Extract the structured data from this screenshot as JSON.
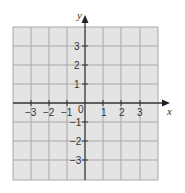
{
  "diagram": {
    "type": "coordinate-grid",
    "colors": {
      "grid_fill": "#e4e4e4",
      "grid_line": "#a8a8a8",
      "axis": "#333333"
    },
    "x_axis": {
      "label": "x",
      "min": -4,
      "max": 4,
      "tick_labels": [
        "−3",
        "−2",
        "−1",
        "0",
        "1",
        "2",
        "3"
      ]
    },
    "y_axis": {
      "label": "y",
      "min": -4,
      "max": 4,
      "tick_labels": [
        "3",
        "2",
        "1",
        "−1",
        "−2",
        "−3"
      ]
    },
    "labels": {
      "x": "x",
      "y": "y",
      "origin": "0",
      "xn3": "−3",
      "xn2": "−2",
      "xn1": "−1",
      "x1": "1",
      "x2": "2",
      "x3": "3",
      "y3": "3",
      "y2": "2",
      "y1": "1",
      "yn1": "−1",
      "yn2": "−2",
      "yn3": "−3"
    }
  }
}
